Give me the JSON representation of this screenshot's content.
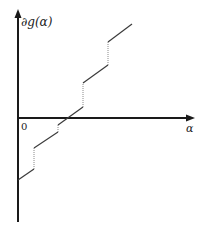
{
  "diagram": {
    "type": "step-subgradient-plot",
    "y_axis_label": "∂g(α)",
    "x_axis_label": "α",
    "origin_label": "0",
    "colors": {
      "axis": "#1a1a1a",
      "solid_segment": "#3a3a3a",
      "dotted_jump": "#8a8a8a"
    },
    "axes": {
      "origin_px": [
        18,
        118
      ],
      "x_axis_end_px": [
        194,
        118
      ],
      "y_axis_top_px": [
        18,
        11
      ],
      "y_axis_bottom_px": [
        18,
        222
      ]
    },
    "solid_segments": [
      {
        "x1": 18,
        "y1": 180,
        "x2": 34,
        "y2": 169
      },
      {
        "x1": 34,
        "y1": 148,
        "x2": 58,
        "y2": 132
      },
      {
        "x1": 58,
        "y1": 125,
        "x2": 83,
        "y2": 107
      },
      {
        "x1": 83,
        "y1": 83,
        "x2": 108,
        "y2": 65
      },
      {
        "x1": 108,
        "y1": 42,
        "x2": 132,
        "y2": 24
      }
    ],
    "dotted_jumps": [
      {
        "x": 34,
        "y1": 169,
        "y2": 148
      },
      {
        "x": 58,
        "y1": 132,
        "y2": 125
      },
      {
        "x": 83,
        "y1": 107,
        "y2": 83
      },
      {
        "x": 108,
        "y1": 65,
        "y2": 42
      }
    ]
  }
}
